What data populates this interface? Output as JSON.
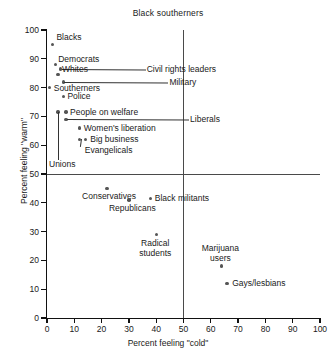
{
  "chart_data": {
    "type": "scatter",
    "title": "Black southerners",
    "xlabel": "Percent feeling \"cold\"",
    "ylabel": "Percent feeling \"warm\"",
    "xlim": [
      0,
      100
    ],
    "ylim": [
      0,
      100
    ],
    "xticks": [
      0,
      10,
      20,
      30,
      40,
      50,
      60,
      70,
      80,
      90,
      100
    ],
    "yticks": [
      0,
      10,
      20,
      30,
      40,
      50,
      60,
      70,
      80,
      90,
      100
    ],
    "grid": false,
    "legend": "none",
    "reference_lines": [
      {
        "orientation": "vertical",
        "value": 50
      },
      {
        "orientation": "horizontal",
        "value": 50
      }
    ],
    "points": [
      {
        "label": "Blacks",
        "x": 2,
        "y": 95,
        "label_dx": 4,
        "label_dy": -11,
        "leader": false
      },
      {
        "label": "Democrats",
        "x": 3,
        "y": 88,
        "label_dx": 3,
        "label_dy": -10,
        "leader": false
      },
      {
        "label": "Civil rights leaders",
        "x": 5,
        "y": 86.5,
        "label_dx": 86,
        "label_dy": -4,
        "leader": true
      },
      {
        "label": "Whites",
        "x": 4,
        "y": 84.5,
        "label_dx": 4,
        "label_dy": -10,
        "leader": false
      },
      {
        "label": "Military",
        "x": 6,
        "y": 82,
        "label_dx": 106,
        "label_dy": -4,
        "leader": true
      },
      {
        "label": "Southerners",
        "x": 1,
        "y": 80,
        "label_dx": 4,
        "label_dy": -4,
        "leader": false
      },
      {
        "label": "Police",
        "x": 6,
        "y": 77,
        "label_dx": 4,
        "label_dy": -4,
        "leader": false
      },
      {
        "label": "People on welfare",
        "x": 7,
        "y": 71.5,
        "label_dx": 4,
        "label_dy": -4,
        "leader": false
      },
      {
        "label": "Unions",
        "x": 4,
        "y": 71.5,
        "label_dx": 0,
        "label_dy": 0,
        "leader": false
      },
      {
        "label": "Liberals",
        "x": 7,
        "y": 69,
        "label_dx": 124,
        "label_dy": -4,
        "leader": true
      },
      {
        "label": "Women's liberation",
        "x": 12,
        "y": 66,
        "label_dx": 4,
        "label_dy": -4,
        "leader": false
      },
      {
        "label": "Big business",
        "x": 14,
        "y": 62,
        "label_dx": 5,
        "label_dy": -4,
        "leader": false
      },
      {
        "label": "Evangelicals",
        "x": 12,
        "y": 62,
        "label_dx": 5,
        "label_dy": 7,
        "leader": false
      },
      {
        "label": "Conservatives",
        "x": 22,
        "y": 45,
        "label_dx": -25,
        "label_dy": 4,
        "leader": false
      },
      {
        "label": "Republicans",
        "x": 30,
        "y": 41,
        "label_dx": -20,
        "label_dy": 4,
        "leader": false
      },
      {
        "label": "Black militants",
        "x": 38,
        "y": 41.5,
        "label_dx": 4,
        "label_dy": -4,
        "leader": false
      },
      {
        "label": "Radical\nstudents",
        "x": 40,
        "y": 29,
        "label_dx": -17,
        "label_dy": 5,
        "leader": false
      },
      {
        "label": "Marijuana\nusers",
        "x": 64,
        "y": 18,
        "label_dx": -20,
        "label_dy": -22,
        "leader": false
      },
      {
        "label": "Gays/lesbians",
        "x": 66,
        "y": 12,
        "label_dx": 5,
        "label_dy": -4,
        "leader": false
      }
    ]
  },
  "colors": {
    "axis": "#111111",
    "reference_line": "#4a4a4a",
    "marker": "#555555",
    "text": "#1a1a1a",
    "background": "#ffffff"
  }
}
